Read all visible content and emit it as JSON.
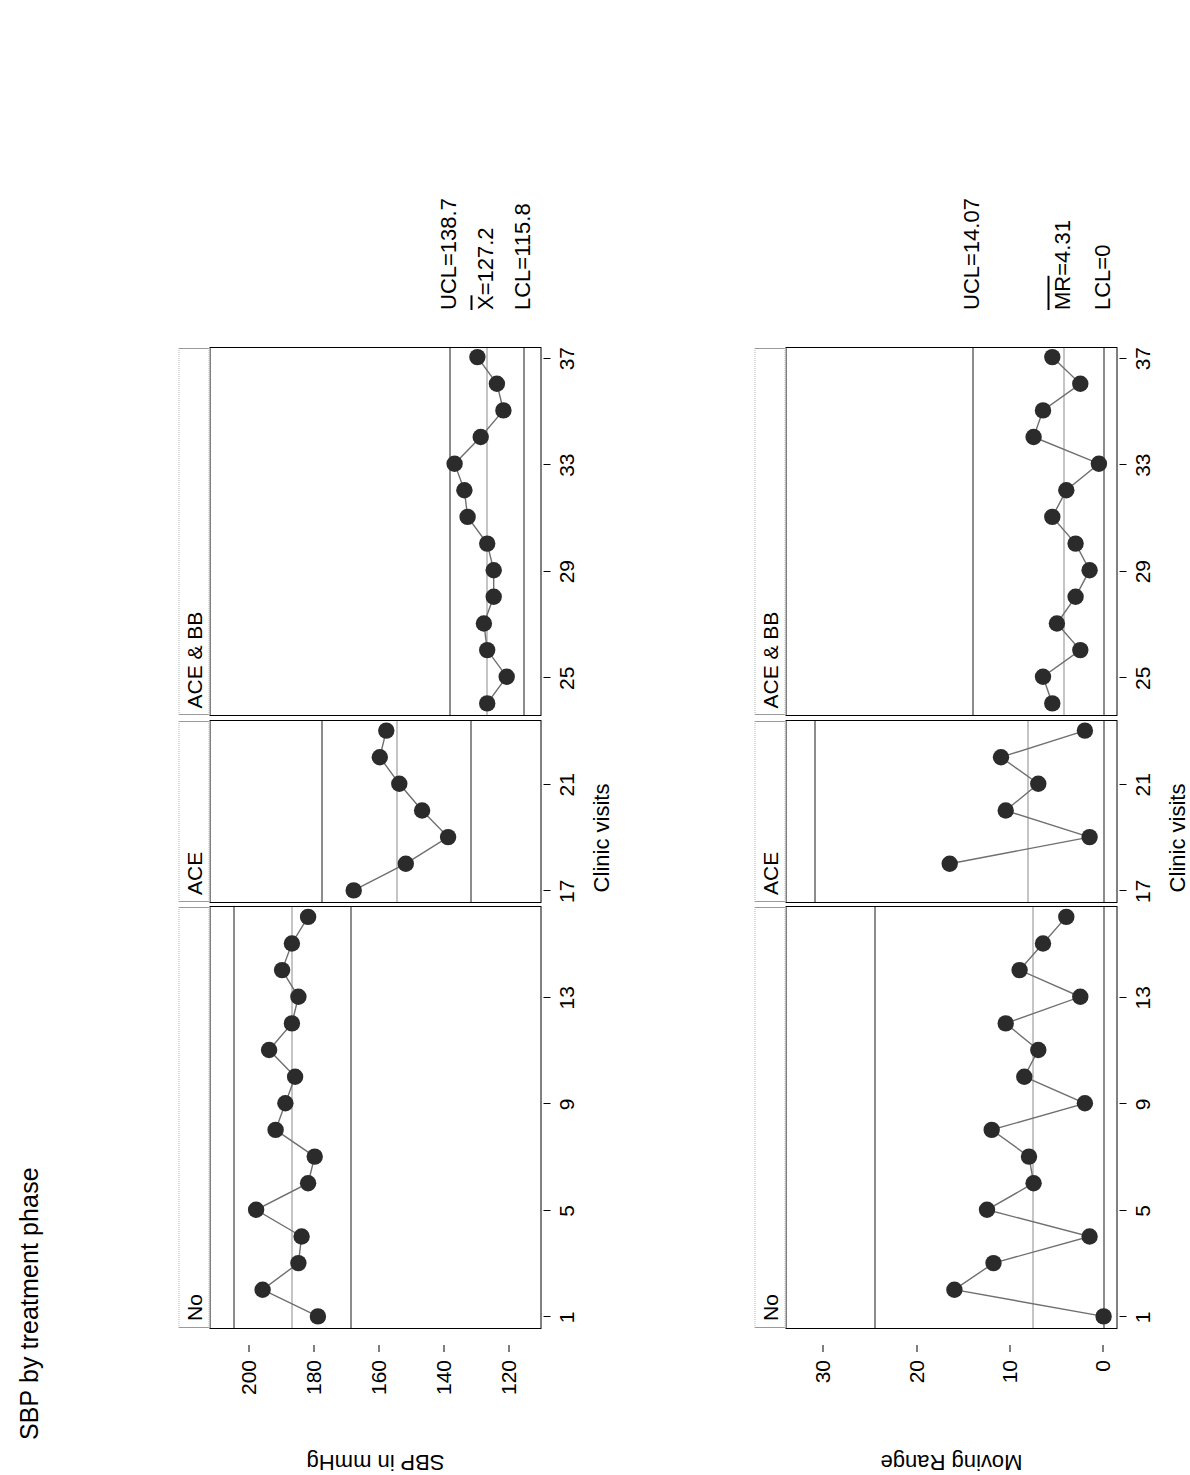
{
  "figure": {
    "title": "SBP by treatment phase",
    "panel_labels": [
      "No",
      "ACE",
      "ACE & BB"
    ],
    "xlabel": "Clinic visits",
    "x_ticks": [
      1,
      5,
      9,
      13,
      17,
      21,
      25,
      29,
      33,
      37
    ],
    "x_range": [
      0,
      38
    ]
  },
  "chart_data": [
    {
      "type": "line",
      "id": "individuals-chart",
      "title": "SBP by treatment phase",
      "ylabel": "SBP in mmHg",
      "xlabel": "Clinic visits",
      "ylim": [
        110,
        212
      ],
      "y_ticks": [
        120,
        140,
        160,
        180,
        200
      ],
      "x_ticks": [
        1,
        5,
        9,
        13,
        17,
        21,
        25,
        29,
        33,
        37
      ],
      "grid": false,
      "legend": "none",
      "panels": [
        {
          "label": "No",
          "x_from": 1,
          "x_to": 16,
          "ucl": 205.0,
          "center": 187.0,
          "lcl": 169.0,
          "ucl_label": "",
          "center_label": "",
          "lcl_label": "",
          "x": [
            1,
            2,
            3,
            4,
            5,
            6,
            7,
            8,
            9,
            10,
            11,
            12,
            13,
            14,
            15,
            16
          ],
          "values": [
            179,
            196,
            185,
            184,
            198,
            182,
            180,
            192,
            189,
            186,
            194,
            187,
            185,
            190,
            187,
            182
          ]
        },
        {
          "label": "ACE",
          "x_from": 17,
          "x_to": 23,
          "ucl": 178.0,
          "center": 155.0,
          "lcl": 132.0,
          "ucl_label": "",
          "center_label": "",
          "lcl_label": "",
          "x": [
            17,
            18,
            19,
            20,
            21,
            22,
            23
          ],
          "values": [
            168,
            152,
            139,
            147,
            154,
            160,
            158
          ]
        },
        {
          "label": "ACE & BB",
          "x_from": 24,
          "x_to": 37,
          "ucl": 138.7,
          "center": 127.2,
          "lcl": 115.8,
          "ucl_label": "UCL=138.7",
          "center_label": "X=127.2",
          "lcl_label": "LCL=115.8",
          "x": [
            24,
            25,
            26,
            27,
            28,
            29,
            30,
            31,
            32,
            33,
            34,
            35,
            36,
            37
          ],
          "values": [
            127,
            121,
            127,
            128,
            125,
            125,
            127,
            133,
            134,
            137,
            129,
            122,
            124,
            130
          ]
        }
      ],
      "limit_annotations": [
        {
          "name": "ucl",
          "text": "UCL=138.7",
          "value": 138.7
        },
        {
          "name": "center",
          "text": "X=127.2",
          "value": 127.2,
          "overline_chars": 1
        },
        {
          "name": "lcl",
          "text": "LCL=115.8",
          "value": 115.8
        }
      ]
    },
    {
      "type": "line",
      "id": "moving-range-chart",
      "title": "",
      "ylabel": "Moving Range",
      "xlabel": "Clinic visits",
      "ylim": [
        -1.6,
        34
      ],
      "y_ticks": [
        0,
        10,
        20,
        30
      ],
      "x_ticks": [
        1,
        5,
        9,
        13,
        17,
        21,
        25,
        29,
        33,
        37
      ],
      "grid": false,
      "legend": "none",
      "panels": [
        {
          "label": "No",
          "x_from": 1,
          "x_to": 16,
          "ucl": 24.6,
          "center": 7.6,
          "lcl": 0,
          "ucl_label": "",
          "center_label": "",
          "lcl_label": "",
          "x": [
            1,
            2,
            3,
            4,
            5,
            6,
            7,
            8,
            9,
            10,
            11,
            12,
            13,
            14,
            15,
            16
          ],
          "values": [
            0,
            16.0,
            11.8,
            1.5,
            12.5,
            7.5,
            8.0,
            12.0,
            2.0,
            8.5,
            7.0,
            10.5,
            2.5,
            9.0,
            6.5,
            4.0
          ]
        },
        {
          "label": "ACE",
          "x_from": 17,
          "x_to": 23,
          "ucl": 31.0,
          "center": 8.2,
          "lcl": 0,
          "ucl_label": "",
          "center_label": "",
          "lcl_label": "",
          "x": [
            18,
            19,
            20,
            21,
            22,
            23
          ],
          "values": [
            16.5,
            1.5,
            10.5,
            7.0,
            11.0,
            2.0
          ]
        },
        {
          "label": "ACE & BB",
          "x_from": 24,
          "x_to": 37,
          "ucl": 14.07,
          "center": 4.31,
          "lcl": 0,
          "ucl_label": "UCL=14.07",
          "center_label": "MR=4.31",
          "lcl_label": "LCL=0",
          "x": [
            24,
            25,
            26,
            27,
            28,
            29,
            30,
            31,
            32,
            33,
            34,
            35,
            36,
            37
          ],
          "values": [
            5.5,
            6.5,
            2.5,
            5.0,
            3.0,
            1.5,
            3.0,
            5.5,
            4.0,
            0.5,
            7.5,
            6.5,
            2.5,
            5.5
          ]
        }
      ],
      "limit_annotations": [
        {
          "name": "ucl",
          "text": "UCL=14.07",
          "value": 14.07
        },
        {
          "name": "center",
          "text": "MR=4.31",
          "value": 4.31,
          "overline_chars": 2
        },
        {
          "name": "lcl",
          "text": "LCL=0",
          "value": 0
        }
      ]
    }
  ]
}
